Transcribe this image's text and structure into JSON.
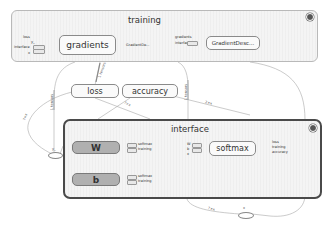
{
  "graph": {
    "groups": {
      "training": {
        "title": "training",
        "nodes": {
          "gradients": {
            "label": "gradients",
            "inputs": [
              "loss",
              "y_",
              "interface",
              "x"
            ],
            "output": "GradientDe..."
          },
          "gradient_descent": {
            "label": "GradientDesc...",
            "inputs": [
              "gradients",
              "interface"
            ]
          }
        }
      },
      "interface": {
        "title": "interface",
        "nodes": {
          "W": {
            "label": "W",
            "outputs": [
              "softmax",
              "training"
            ]
          },
          "b": {
            "label": "b",
            "outputs": [
              "softmax",
              "training"
            ]
          },
          "softmax": {
            "label": "softmax",
            "inputs": [
              "W",
              "b",
              "x"
            ],
            "outputs": [
              "loss",
              "training",
              "accuracy"
            ]
          }
        }
      }
    },
    "nodes": {
      "loss": {
        "label": "loss"
      },
      "accuracy": {
        "label": "accuracy"
      },
      "y_": {
        "label": "y_"
      },
      "x": {
        "label": "x"
      }
    },
    "edge_labels": {
      "training_to_loss": "1 tensors",
      "training_to_y": "1 tensors",
      "loss_to_y": "?×x",
      "accuracy_edge": "2×x",
      "loss_edge": "?×x",
      "training_right": "1 tensors",
      "right_edge": "?×x",
      "softmax_to_x": "?×x",
      "x_label": "x"
    },
    "colors": {
      "group_fill": "#f4f4f4",
      "group_border_training": "#b9b9b9",
      "group_border_interface": "#4a4a4a",
      "variable_fill": "#b0b0b0",
      "edge": "#9a9a9a"
    }
  }
}
